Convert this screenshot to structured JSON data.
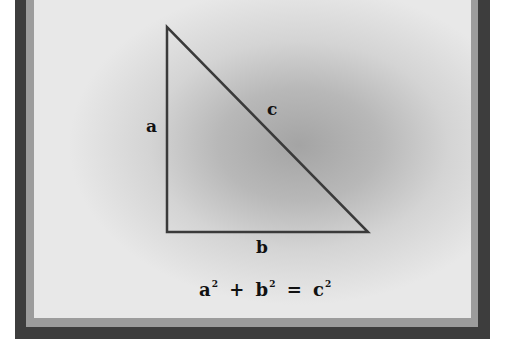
{
  "diagram": {
    "triangle": {
      "vertices": [
        [
          167,
          27
        ],
        [
          167,
          232
        ],
        [
          368,
          232
        ]
      ],
      "stroke_color": "#3a3a3a"
    },
    "labels": {
      "side_a": "a",
      "side_b": "b",
      "side_c": "c"
    },
    "equation": {
      "term1": "a",
      "exp1": "2",
      "plus": "+",
      "term2": "b",
      "exp2": "2",
      "equals": "=",
      "term3": "c",
      "exp3": "2"
    },
    "colors": {
      "outer_border": "#3d3d3d",
      "inner_border": "#9c9c9c",
      "panel": "#e8e8e8"
    }
  }
}
